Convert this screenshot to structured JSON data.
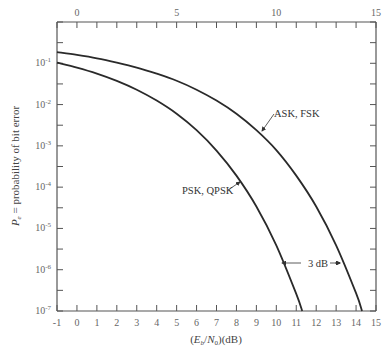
{
  "chart_data": {
    "type": "line",
    "title": "",
    "xlabel": "(E_b/N_0)(dB)",
    "xlabel_parts": {
      "open": "(",
      "E": "E",
      "b": "b",
      "slash": "/",
      "N": "N",
      "zero": "0",
      "close": ")(dB)"
    },
    "ylabel": "P_e = probability of bit error",
    "ylabel_parts": {
      "P": "P",
      "e": "e",
      "rest": " = probability of bit error"
    },
    "xlim": [
      -1,
      15
    ],
    "ylim": [
      1e-07,
      1
    ],
    "yscale": "log",
    "grid": false,
    "x_ticks_bottom": [
      "-1",
      "0",
      "1",
      "2",
      "3",
      "4",
      "5",
      "6",
      "7",
      "8",
      "9",
      "10",
      "11",
      "12",
      "13",
      "14",
      "15"
    ],
    "x_ticks_top": [
      "0",
      "5",
      "10",
      "15"
    ],
    "y_ticks": [
      {
        "label": "10",
        "exp": "-1",
        "value": 0.1
      },
      {
        "label": "10",
        "exp": "-2",
        "value": 0.01
      },
      {
        "label": "10",
        "exp": "-3",
        "value": 0.001
      },
      {
        "label": "10",
        "exp": "-4",
        "value": 0.0001
      },
      {
        "label": "10",
        "exp": "-5",
        "value": 1e-05
      },
      {
        "label": "10",
        "exp": "-6",
        "value": 1e-06
      },
      {
        "label": "10",
        "exp": "-7",
        "value": 1e-07
      }
    ],
    "series": [
      {
        "name": "ASK, FSK",
        "x": [
          -1,
          0,
          1,
          2,
          3,
          4,
          5,
          6,
          7,
          8,
          9,
          10,
          11,
          12,
          13,
          14,
          14.3
        ],
        "values": [
          0.186,
          0.159,
          0.132,
          0.104,
          0.079,
          0.056,
          0.0377,
          0.0229,
          0.0125,
          0.006,
          0.0024,
          0.00079,
          0.00019,
          3.4e-05,
          3.9e-06,
          2.7e-07,
          1e-07
        ]
      },
      {
        "name": "PSK, QPSK",
        "x": [
          -1,
          0,
          1,
          2,
          3,
          4,
          5,
          6,
          7,
          8,
          9,
          10,
          11,
          11.3
        ],
        "values": [
          0.104,
          0.0786,
          0.0563,
          0.0375,
          0.0229,
          0.0125,
          0.006,
          0.0024,
          0.00077,
          0.00019,
          3.4e-05,
          3.9e-06,
          2.6e-07,
          1e-07
        ]
      }
    ],
    "annotations": [
      {
        "text": "ASK, FSK",
        "target_series": "ASK, FSK"
      },
      {
        "text": "PSK, QPSK",
        "target_series": "PSK, QPSK"
      },
      {
        "text": "3 dB",
        "type": "double-arrow",
        "between": [
          "PSK, QPSK",
          "ASK, FSK"
        ]
      }
    ]
  },
  "style": {
    "axis_color": "#555555",
    "curve_color": "#2a2a2a",
    "text_color": "#555555"
  }
}
